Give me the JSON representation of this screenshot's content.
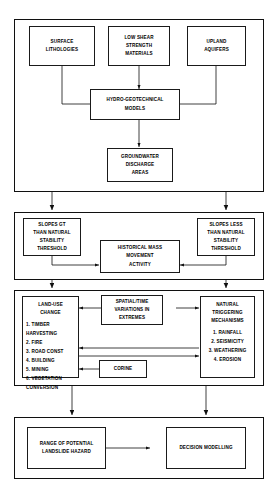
{
  "diagram": {
    "line_color": "#101010",
    "box_fill": "#ffffff",
    "panels": [
      {
        "id": "panel-hydrogeotechnical",
        "label": "Hydro-geotechnical inputs panel"
      },
      {
        "id": "panel-slope-stability",
        "label": "Slope stability thresholds panel"
      },
      {
        "id": "panel-landuse-triggering",
        "label": "Land-use change and triggering mechanisms panel"
      },
      {
        "id": "panel-outcome",
        "label": "Hazard range and decision modelling panel"
      }
    ]
  },
  "nodes": {
    "surface_lithologies": "SURFACE\nLITHOLOGIES",
    "low_shear": "LOW SHEAR\nSTRENGTH\nMATERIALS",
    "upland_aquifers": "UPLAND\nAQUIFERS",
    "hydro_models": "HYDRO-GEOTECHNICAL\nMODELS",
    "groundwater": "GROUNDWATER\nDISCHARGE\nAREAS",
    "slopes_gt": "SLOPES GT\nTHAN NATURAL\nSTABILITY\nTHRESHOLD",
    "slopes_less": "SLOPES LESS\nTHAN NATURAL\nSTABILITY\nTHRESHOLD",
    "historical_mass": "HISTORICAL MASS\nMOVEMENT\nACTIVITY",
    "landuse_title": "LAND-USE\nCHANGE",
    "landuse_list": "1. TIMBER\n    HARVESTING\n2. FIRE\n3. ROAD CONST\n4. BUILDING\n5. MINING\n6. VEGETATION\n    CONVERSION",
    "spatial_time": "SPATIAL/TIME\nVARIATIONS IN\nEXTREMES",
    "natural_title": "NATURAL\nTRIGGERING\nMECHANISMS",
    "natural_list": "1. RAINFALL\n2. SEISMICITY\n3. WEATHERING\n4. EROSION",
    "corine": "CORINE",
    "hazard_range": "RANGE OF POTENTIAL\nLANDSLIDE HAZARD",
    "decision_modelling": "DECISION MODELLING"
  }
}
